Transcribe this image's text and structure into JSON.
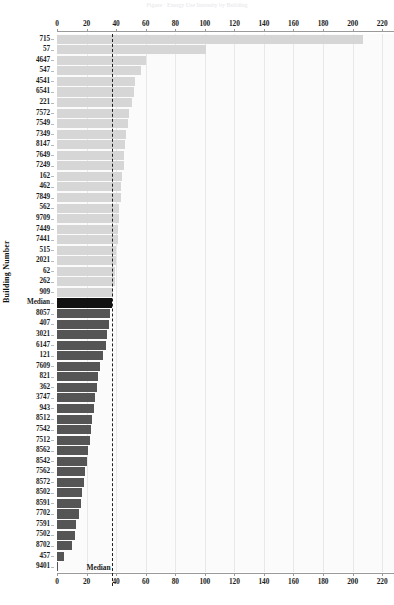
{
  "header": {
    "ghost_text": "Figure  ·  Energy Use Intensity by Building"
  },
  "axis": {
    "ylabel": "Building Number",
    "xlabel": "",
    "x_ticks": [
      0,
      20,
      40,
      60,
      80,
      100,
      120,
      140,
      160,
      180,
      200,
      220
    ],
    "x_min": 0,
    "x_max": 228,
    "median_value": 37,
    "median_label": "Median"
  },
  "colors": {
    "bar_above_median": "#d6d6d6",
    "bar_median": "#111111",
    "bar_below_median": "#555555",
    "gridline": "#e8e8e8",
    "median_line": "#202020",
    "plot_background": "#fbfbfb",
    "text": "#1d1d1d"
  },
  "chart_data": {
    "type": "bar",
    "orientation": "horizontal",
    "title": "",
    "xlabel": "",
    "ylabel": "Building Number",
    "xlim": [
      0,
      228
    ],
    "grid": true,
    "legend": null,
    "annotations": [
      {
        "text": "Median",
        "value": 37,
        "style": "dashed-vertical-line"
      }
    ],
    "categories": [
      "715",
      "57",
      "4647",
      "547",
      "4541",
      "6541",
      "221",
      "7572",
      "7549",
      "7349",
      "8147",
      "7649",
      "7249",
      "162",
      "462",
      "7849",
      "562",
      "9709",
      "7449",
      "7441",
      "515",
      "2021",
      "62",
      "262",
      "909",
      "Median",
      "8057",
      "407",
      "3021",
      "6147",
      "121",
      "7609",
      "821",
      "362",
      "3747",
      "943",
      "8512",
      "7542",
      "7512",
      "8562",
      "8542",
      "7562",
      "8572",
      "8502",
      "8591",
      "7702",
      "7591",
      "7502",
      "8702",
      "457",
      "9401"
    ],
    "values": [
      207,
      101,
      60,
      57,
      53,
      52,
      51,
      49,
      48,
      47,
      46,
      45,
      45,
      44,
      43,
      43,
      42,
      42,
      41,
      41,
      40,
      40,
      39,
      39,
      38,
      37,
      36,
      35,
      34,
      33,
      31,
      29,
      28,
      27,
      26,
      25,
      24,
      23,
      22,
      21,
      20,
      19,
      18,
      17,
      16,
      15,
      13,
      12,
      10,
      5,
      1
    ],
    "median_index": 25
  }
}
